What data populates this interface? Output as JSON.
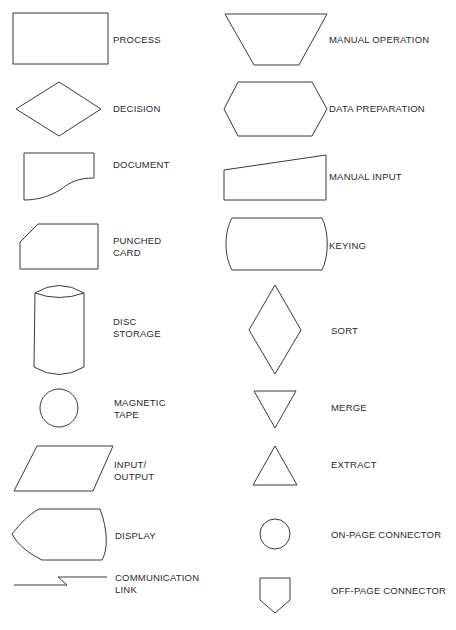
{
  "figure": {
    "left_column": [
      {
        "id": "process",
        "lines": [
          "PROCESS"
        ]
      },
      {
        "id": "decision",
        "lines": [
          "DECISION"
        ]
      },
      {
        "id": "document",
        "lines": [
          "DOCUMENT"
        ]
      },
      {
        "id": "punched-card",
        "lines": [
          "PUNCHED",
          "CARD"
        ]
      },
      {
        "id": "disc-storage",
        "lines": [
          "DISC",
          "STORAGE"
        ]
      },
      {
        "id": "magnetic-tape",
        "lines": [
          "MAGNETIC",
          "TAPE"
        ]
      },
      {
        "id": "input-output",
        "lines": [
          "INPUT/",
          "OUTPUT"
        ]
      },
      {
        "id": "display",
        "lines": [
          "DISPLAY"
        ]
      },
      {
        "id": "communication-link",
        "lines": [
          "COMMUNICATION",
          "LINK"
        ]
      }
    ],
    "right_column": [
      {
        "id": "manual-operation",
        "lines": [
          "MANUAL OPERATION"
        ]
      },
      {
        "id": "data-preparation",
        "lines": [
          "DATA PREPARATION"
        ]
      },
      {
        "id": "manual-input",
        "lines": [
          "MANUAL INPUT"
        ]
      },
      {
        "id": "keying",
        "lines": [
          "KEYING"
        ]
      },
      {
        "id": "sort",
        "lines": [
          "SORT"
        ]
      },
      {
        "id": "merge",
        "lines": [
          "MERGE"
        ]
      },
      {
        "id": "extract",
        "lines": [
          "EXTRACT"
        ]
      },
      {
        "id": "on-page-connector",
        "lines": [
          "ON-PAGE CONNECTOR"
        ]
      },
      {
        "id": "off-page-connector",
        "lines": [
          "OFF-PAGE CONNECTOR"
        ]
      }
    ]
  },
  "colors": {
    "stroke": "#3a3a3a",
    "text": "#2a2a2a",
    "background": "#ffffff"
  }
}
